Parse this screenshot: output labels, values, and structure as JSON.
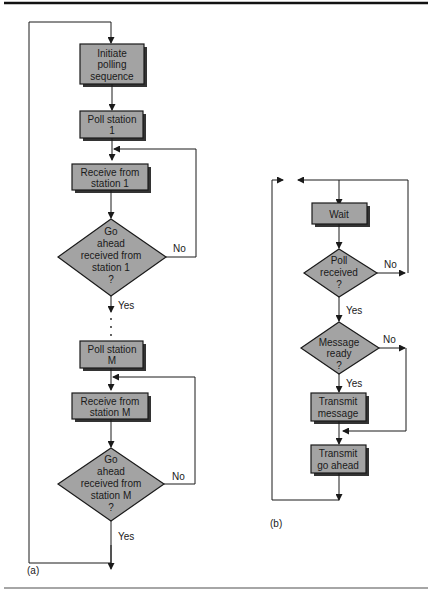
{
  "diagram_a": {
    "caption": "(a)",
    "nodes": [
      {
        "id": "initiate",
        "type": "process",
        "lines": [
          "Initiate",
          "polling",
          "sequence"
        ]
      },
      {
        "id": "poll1",
        "type": "process",
        "lines": [
          "Poll station",
          "1"
        ]
      },
      {
        "id": "recv1",
        "type": "process",
        "lines": [
          "Receive from",
          "station 1"
        ]
      },
      {
        "id": "dec1",
        "type": "decision",
        "lines": [
          "Go",
          "ahead",
          "received from",
          "station 1",
          "?"
        ]
      },
      {
        "id": "pollM",
        "type": "process",
        "lines": [
          "Poll station",
          "M"
        ]
      },
      {
        "id": "recvM",
        "type": "process",
        "lines": [
          "Receive from",
          "station M"
        ]
      },
      {
        "id": "decM",
        "type": "decision",
        "lines": [
          "Go",
          "ahead",
          "received from",
          "station M",
          "?"
        ]
      }
    ],
    "edge_labels": {
      "no1": "No",
      "yes1": "Yes",
      "noM": "No",
      "yesM": "Yes",
      "ellipsis": "⋮"
    }
  },
  "diagram_b": {
    "caption": "(b)",
    "nodes": [
      {
        "id": "wait",
        "type": "process",
        "lines": [
          "Wait"
        ]
      },
      {
        "id": "pollrecv",
        "type": "decision",
        "lines": [
          "Poll",
          "received",
          "?"
        ]
      },
      {
        "id": "msgready",
        "type": "decision",
        "lines": [
          "Message",
          "ready",
          "?"
        ]
      },
      {
        "id": "txmsg",
        "type": "process",
        "lines": [
          "Transmit",
          "message"
        ]
      },
      {
        "id": "txga",
        "type": "process",
        "lines": [
          "Transmit",
          "go ahead"
        ]
      }
    ],
    "edge_labels": {
      "no_poll": "No",
      "yes_poll": "Yes",
      "no_msg": "No",
      "yes_msg": "Yes"
    }
  },
  "colors": {
    "box_fill": "#a3a3a3",
    "line": "#1a1a1a"
  }
}
